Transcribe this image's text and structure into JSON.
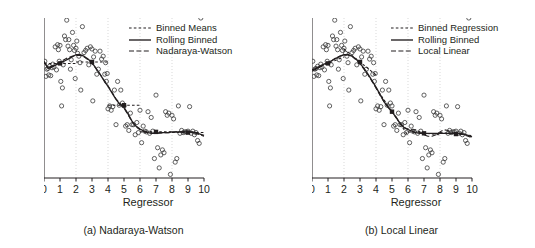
{
  "figure": {
    "background": "#ffffff",
    "ink": "#231f20",
    "grid_color": "#c9c9c9"
  },
  "panels": [
    {
      "id": "panel-a",
      "caption": "(a) Nadaraya-Watson",
      "xlabel": "Regressor",
      "ylabel": "Dependent variable",
      "legend": [
        {
          "label": "Binned Means",
          "style": "dashed-short"
        },
        {
          "label": "Rolling Binned",
          "style": "solid"
        },
        {
          "label": "Nadaraya-Watson",
          "style": "dashed-long"
        }
      ]
    },
    {
      "id": "panel-b",
      "caption": "(b) Local Linear",
      "xlabel": "Regressor",
      "ylabel": "Dependent variable",
      "legend": [
        {
          "label": "Binned Regression",
          "style": "dashed-short"
        },
        {
          "label": "Rolling Binned",
          "style": "solid"
        },
        {
          "label": "Local Linear",
          "style": "dashed-long"
        }
      ]
    }
  ],
  "chart_data": [
    {
      "type": "scatter",
      "title": "(a) Nadaraya-Watson",
      "xlabel": "Regressor",
      "ylabel": "Dependent variable",
      "xlim": [
        0,
        10
      ],
      "ylim": [
        -0.72,
        1.5
      ],
      "xticks": [
        0,
        1,
        2,
        3,
        4,
        5,
        6,
        7,
        8,
        9,
        10
      ],
      "yticks": [
        -0.5,
        0.0,
        0.5,
        1.0,
        1.5
      ],
      "ytick_labels": [
        "-0.5",
        "0.0",
        "0.5",
        "1.0",
        "1.5"
      ],
      "grid": "vertical-dotted",
      "gridlines_x": [
        2,
        4,
        6,
        8
      ],
      "legend_position": "top-right",
      "scatter": {
        "marker": "open-circle",
        "x": [
          0.05,
          0.12,
          0.18,
          0.25,
          0.3,
          0.35,
          0.42,
          0.5,
          0.55,
          0.62,
          0.7,
          0.78,
          0.85,
          0.9,
          0.95,
          1.0,
          1.05,
          1.1,
          1.15,
          1.2,
          1.28,
          1.35,
          1.42,
          1.5,
          1.55,
          1.6,
          1.65,
          1.7,
          1.78,
          1.85,
          1.9,
          1.95,
          2.0,
          2.05,
          2.1,
          2.18,
          2.25,
          2.3,
          2.4,
          2.5,
          2.6,
          2.7,
          2.8,
          2.9,
          3.0,
          3.05,
          3.1,
          3.2,
          3.3,
          3.4,
          3.5,
          3.6,
          3.7,
          3.8,
          3.85,
          3.9,
          3.95,
          4.0,
          4.1,
          4.2,
          4.3,
          4.4,
          4.5,
          4.6,
          4.7,
          4.8,
          4.9,
          5.0,
          5.1,
          5.2,
          5.3,
          5.4,
          5.5,
          5.6,
          5.7,
          5.8,
          5.9,
          6.0,
          6.1,
          6.2,
          6.3,
          6.4,
          6.5,
          6.6,
          6.7,
          6.8,
          6.9,
          7.0,
          7.1,
          7.2,
          7.3,
          7.4,
          7.5,
          7.6,
          7.7,
          7.8,
          7.9,
          8.0,
          8.1,
          8.2,
          8.3,
          8.4,
          8.5,
          8.6,
          8.7,
          8.8,
          8.9,
          9.0,
          9.1,
          9.2,
          9.3,
          9.4,
          9.5,
          9.6,
          9.7,
          9.8
        ],
        "y": [
          0.9,
          0.69,
          0.79,
          0.8,
          0.71,
          0.83,
          0.7,
          0.81,
          0.86,
          0.82,
          1.1,
          0.78,
          1.13,
          1.06,
          0.9,
          1.12,
          0.62,
          0.28,
          0.53,
          0.85,
          1.25,
          1.2,
          1.47,
          1.11,
          1.2,
          1.06,
          0.79,
          0.92,
          1.3,
          1.12,
          1.05,
          0.66,
          1.08,
          1.18,
          1.01,
          0.97,
          0.88,
          0.5,
          1.38,
          1.02,
          1.05,
          1.08,
          0.85,
          1.1,
          1.07,
          0.35,
          0.96,
          1.04,
          0.72,
          0.79,
          1.04,
          0.93,
          0.97,
          0.72,
          0.88,
          0.62,
          0.73,
          0.24,
          0.28,
          0.22,
          0.27,
          0.5,
          0.02,
          0.62,
          0.29,
          0.5,
          0.32,
          0.28,
          0.0,
          0.02,
          -0.06,
          0.18,
          0.02,
          0.02,
          -0.12,
          0.05,
          -0.09,
          0.22,
          -0.23,
          0.0,
          -0.07,
          -0.08,
          0.2,
          -0.1,
          0.12,
          -0.07,
          -0.45,
          0.43,
          -0.3,
          -0.58,
          -0.4,
          -0.33,
          -0.37,
          0.2,
          0.15,
          0.18,
          -0.67,
          0.15,
          0.1,
          -0.5,
          -0.45,
          0.28,
          -0.1,
          -0.06,
          -0.09,
          -0.08,
          -0.08,
          -0.07,
          0.27,
          -0.1,
          -0.07,
          -0.12,
          -0.09,
          -0.2,
          -0.24
        ]
      },
      "series": [
        {
          "name": "Binned Means",
          "style": "dashed-short",
          "description": "piecewise-constant bin averages over bins [0,2),[2,4),[4,6),[6,8),[8,10]",
          "bins": [
            [
              0,
              2
            ],
            [
              2,
              4
            ],
            [
              4,
              6
            ],
            [
              6,
              8
            ],
            [
              8,
              10
            ]
          ],
          "bin_centers": [
            1,
            3,
            5,
            7,
            9
          ],
          "values": [
            0.87,
            0.89,
            0.29,
            -0.08,
            -0.09
          ],
          "marker": "filled-square"
        },
        {
          "name": "Rolling Binned",
          "style": "solid",
          "description": "rolling-window binned estimate, stepped curve",
          "x": [
            0.0,
            0.25,
            0.5,
            0.75,
            1.0,
            1.25,
            1.5,
            1.75,
            2.0,
            2.25,
            2.5,
            2.75,
            3.0,
            3.25,
            3.5,
            3.75,
            4.0,
            4.25,
            4.5,
            4.75,
            5.0,
            5.25,
            5.5,
            5.75,
            6.0,
            6.25,
            6.5,
            6.75,
            7.0,
            7.25,
            7.5,
            7.75,
            8.0,
            8.25,
            8.5,
            8.75,
            9.0,
            9.25,
            9.5,
            9.75,
            10.0
          ],
          "y": [
            0.9,
            0.8,
            0.82,
            0.85,
            0.88,
            0.9,
            0.93,
            0.96,
            0.99,
            0.99,
            0.97,
            0.93,
            0.88,
            0.8,
            0.72,
            0.63,
            0.55,
            0.46,
            0.37,
            0.3,
            0.26,
            0.17,
            0.07,
            0.0,
            -0.04,
            -0.07,
            -0.09,
            -0.1,
            -0.1,
            -0.09,
            -0.09,
            -0.09,
            -0.08,
            -0.08,
            -0.08,
            -0.08,
            -0.08,
            -0.08,
            -0.09,
            -0.11,
            -0.13
          ]
        },
        {
          "name": "Nadaraya-Watson",
          "style": "dashed-long",
          "description": "kernel regression smooth, nearly overlays rolling binned",
          "x": [
            0.0,
            0.25,
            0.5,
            0.75,
            1.0,
            1.25,
            1.5,
            1.75,
            2.0,
            2.25,
            2.5,
            2.75,
            3.0,
            3.25,
            3.5,
            3.75,
            4.0,
            4.25,
            4.5,
            4.75,
            5.0,
            5.25,
            5.5,
            5.75,
            6.0,
            6.25,
            6.5,
            6.75,
            7.0,
            7.25,
            7.5,
            7.75,
            8.0,
            8.25,
            8.5,
            8.75,
            9.0,
            9.25,
            9.5,
            9.75,
            10.0
          ],
          "y": [
            0.88,
            0.82,
            0.83,
            0.86,
            0.89,
            0.92,
            0.95,
            0.97,
            0.98,
            0.98,
            0.96,
            0.92,
            0.87,
            0.8,
            0.72,
            0.64,
            0.56,
            0.47,
            0.38,
            0.31,
            0.25,
            0.16,
            0.06,
            -0.01,
            -0.05,
            -0.08,
            -0.09,
            -0.1,
            -0.1,
            -0.1,
            -0.09,
            -0.09,
            -0.09,
            -0.08,
            -0.08,
            -0.08,
            -0.08,
            -0.09,
            -0.1,
            -0.12,
            -0.14
          ]
        }
      ]
    },
    {
      "type": "scatter",
      "title": "(b) Local Linear",
      "xlabel": "Regressor",
      "ylabel": "Dependent variable",
      "xlim": [
        0,
        10
      ],
      "ylim": [
        -0.72,
        1.5
      ],
      "xticks": [
        0,
        1,
        2,
        3,
        4,
        5,
        6,
        7,
        8,
        9,
        10
      ],
      "yticks": [
        -0.5,
        0.0,
        0.5,
        1.0,
        1.5
      ],
      "ytick_labels": [
        "-0.5",
        "0.0",
        "0.5",
        "1.0",
        "1.5"
      ],
      "grid": "vertical-dotted",
      "gridlines_x": [
        2,
        4,
        6,
        8
      ],
      "legend_position": "top-right",
      "scatter": {
        "marker": "open-circle",
        "x": [
          0.05,
          0.12,
          0.18,
          0.25,
          0.3,
          0.35,
          0.42,
          0.5,
          0.55,
          0.62,
          0.7,
          0.78,
          0.85,
          0.9,
          0.95,
          1.0,
          1.05,
          1.1,
          1.15,
          1.2,
          1.28,
          1.35,
          1.42,
          1.5,
          1.55,
          1.6,
          1.65,
          1.7,
          1.78,
          1.85,
          1.9,
          1.95,
          2.0,
          2.05,
          2.1,
          2.18,
          2.25,
          2.3,
          2.4,
          2.5,
          2.6,
          2.7,
          2.8,
          2.9,
          3.0,
          3.05,
          3.1,
          3.2,
          3.3,
          3.4,
          3.5,
          3.6,
          3.7,
          3.8,
          3.85,
          3.9,
          3.95,
          4.0,
          4.1,
          4.2,
          4.3,
          4.4,
          4.5,
          4.6,
          4.7,
          4.8,
          4.9,
          5.0,
          5.1,
          5.2,
          5.3,
          5.4,
          5.5,
          5.6,
          5.7,
          5.8,
          5.9,
          6.0,
          6.1,
          6.2,
          6.3,
          6.4,
          6.5,
          6.6,
          6.7,
          6.8,
          6.9,
          7.0,
          7.1,
          7.2,
          7.3,
          7.4,
          7.5,
          7.6,
          7.7,
          7.8,
          7.9,
          8.0,
          8.1,
          8.2,
          8.3,
          8.4,
          8.5,
          8.6,
          8.7,
          8.8,
          8.9,
          9.0,
          9.1,
          9.2,
          9.3,
          9.4,
          9.5,
          9.6,
          9.7,
          9.8
        ],
        "y": [
          0.9,
          0.69,
          0.79,
          0.8,
          0.71,
          0.83,
          0.7,
          0.81,
          0.86,
          0.82,
          1.1,
          0.78,
          1.13,
          1.06,
          0.9,
          1.12,
          0.62,
          0.28,
          0.53,
          0.85,
          1.25,
          1.2,
          1.47,
          1.11,
          1.2,
          1.06,
          0.79,
          0.92,
          1.3,
          1.12,
          1.05,
          0.66,
          1.08,
          1.18,
          1.01,
          0.97,
          0.88,
          0.5,
          1.38,
          1.02,
          1.05,
          1.08,
          0.85,
          1.1,
          1.07,
          0.35,
          0.96,
          1.04,
          0.72,
          0.79,
          1.04,
          0.93,
          0.97,
          0.72,
          0.88,
          0.62,
          0.73,
          0.24,
          0.28,
          0.22,
          0.27,
          0.5,
          0.02,
          0.62,
          0.29,
          0.5,
          0.32,
          0.28,
          0.0,
          0.02,
          -0.06,
          0.18,
          0.02,
          0.02,
          -0.12,
          0.05,
          -0.09,
          0.22,
          -0.23,
          0.0,
          -0.07,
          -0.08,
          0.2,
          -0.1,
          0.12,
          -0.07,
          -0.45,
          0.43,
          -0.3,
          -0.58,
          -0.4,
          -0.33,
          -0.37,
          0.2,
          0.15,
          0.18,
          -0.67,
          0.15,
          0.1,
          -0.5,
          -0.45,
          0.28,
          -0.1,
          -0.06,
          -0.09,
          -0.08,
          -0.08,
          -0.07,
          0.27,
          -0.1,
          -0.07,
          -0.12,
          -0.09,
          -0.2,
          -0.24
        ]
      },
      "series": [
        {
          "name": "Binned Regression",
          "style": "dashed-short",
          "description": "piecewise-linear (sloped) fit within each bin",
          "bins": [
            [
              0,
              2
            ],
            [
              2,
              4
            ],
            [
              4,
              6
            ],
            [
              6,
              8
            ],
            [
              8,
              10
            ]
          ],
          "bin_centers": [
            1,
            3,
            5,
            7,
            9
          ],
          "values": [
            0.87,
            0.89,
            0.2,
            -0.1,
            -0.11
          ],
          "slopes": [
            0.09,
            -0.18,
            -0.33,
            -0.02,
            -0.02
          ],
          "marker": "filled-square"
        },
        {
          "name": "Rolling Binned",
          "style": "solid",
          "description": "rolling-window binned estimate, stepped curve",
          "x": [
            0.0,
            0.25,
            0.5,
            0.75,
            1.0,
            1.25,
            1.5,
            1.75,
            2.0,
            2.25,
            2.5,
            2.75,
            3.0,
            3.25,
            3.5,
            3.75,
            4.0,
            4.25,
            4.5,
            4.75,
            5.0,
            5.25,
            5.5,
            5.75,
            6.0,
            6.25,
            6.5,
            6.75,
            7.0,
            7.25,
            7.5,
            7.75,
            8.0,
            8.25,
            8.5,
            8.75,
            9.0,
            9.25,
            9.5,
            9.75,
            10.0
          ],
          "y": [
            0.78,
            0.8,
            0.83,
            0.86,
            0.88,
            0.91,
            0.94,
            0.97,
            0.99,
            0.99,
            0.97,
            0.93,
            0.87,
            0.8,
            0.72,
            0.63,
            0.54,
            0.44,
            0.34,
            0.26,
            0.2,
            0.12,
            0.04,
            -0.02,
            -0.05,
            -0.07,
            -0.09,
            -0.1,
            -0.1,
            -0.1,
            -0.1,
            -0.1,
            -0.1,
            -0.1,
            -0.1,
            -0.1,
            -0.1,
            -0.1,
            -0.11,
            -0.13,
            -0.15
          ]
        },
        {
          "name": "Local Linear",
          "style": "dashed-long",
          "description": "local linear smoother, slight wiggle around x=6.5-8.5",
          "x": [
            0.0,
            0.25,
            0.5,
            0.75,
            1.0,
            1.25,
            1.5,
            1.75,
            2.0,
            2.25,
            2.5,
            2.75,
            3.0,
            3.25,
            3.5,
            3.75,
            4.0,
            4.25,
            4.5,
            4.75,
            5.0,
            5.25,
            5.5,
            5.75,
            6.0,
            6.25,
            6.5,
            6.75,
            7.0,
            7.25,
            7.5,
            7.75,
            8.0,
            8.25,
            8.5,
            8.75,
            9.0,
            9.25,
            9.5,
            9.75,
            10.0
          ],
          "y": [
            0.76,
            0.79,
            0.82,
            0.85,
            0.88,
            0.91,
            0.95,
            0.97,
            0.99,
            0.99,
            0.97,
            0.92,
            0.86,
            0.79,
            0.71,
            0.62,
            0.53,
            0.43,
            0.34,
            0.27,
            0.21,
            0.13,
            0.04,
            -0.02,
            -0.04,
            -0.05,
            -0.05,
            -0.08,
            -0.12,
            -0.14,
            -0.14,
            -0.12,
            -0.08,
            -0.05,
            -0.06,
            -0.09,
            -0.11,
            -0.11,
            -0.12,
            -0.14,
            -0.16
          ]
        }
      ]
    }
  ]
}
